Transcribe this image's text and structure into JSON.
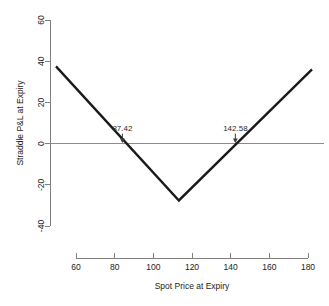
{
  "chart_data": {
    "type": "line",
    "title": "",
    "xlabel": "Spot Price at Expiry",
    "ylabel": "Straddle P&L at Expiry",
    "xlim": [
      55,
      180
    ],
    "ylim": [
      -40,
      60
    ],
    "xticks": [
      60,
      80,
      100,
      120,
      140,
      160,
      180
    ],
    "xtick_labels": [
      "60",
      "80",
      "100",
      "120",
      "140",
      "160",
      "180"
    ],
    "yticks": [
      -40,
      -20,
      0,
      20,
      40,
      60
    ],
    "ytick_labels": [
      "-40",
      "-20",
      "0",
      "20",
      "40",
      "60"
    ],
    "grid": false,
    "legend": null,
    "series": [
      {
        "name": "Straddle P&L at Expiry",
        "color": "#1a1a1a",
        "x": [
          55,
          115,
          180
        ],
        "values": [
          37.5,
          -27.6,
          36.0
        ]
      }
    ],
    "reference_lines": [
      {
        "name": "zero-line",
        "orientation": "horizontal",
        "value": 0,
        "color": "#8c8c8c"
      }
    ],
    "annotations": [
      {
        "name": "lower-breakeven",
        "label": "87.42",
        "x": 87.42,
        "y": 0
      },
      {
        "name": "upper-breakeven",
        "label": "142.58",
        "x": 142.58,
        "y": 0
      }
    ],
    "strike": 115,
    "premium": 27.58
  }
}
